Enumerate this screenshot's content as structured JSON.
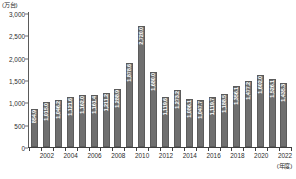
{
  "chart_data": {
    "type": "bar",
    "title": "",
    "subtitle": "",
    "xlabel": "(年度)",
    "ylabel": "(万台)",
    "ylim": [
      0,
      3000
    ],
    "ytick_labels": [
      "0",
      "500",
      "1,000",
      "1,500",
      "2,000",
      "2,500",
      "3,000"
    ],
    "ytick_values": [
      0,
      500,
      1000,
      1500,
      2000,
      2500,
      3000
    ],
    "grid": false,
    "legend": false,
    "bar_color": "#6f6f6f",
    "bar_label_color": "#ffffff",
    "axis_color": "#3f3f3f",
    "categories": [
      "2001",
      "2002",
      "2003",
      "2004",
      "2005",
      "2006",
      "2007",
      "2008",
      "2009",
      "2010",
      "2011",
      "2012",
      "2013",
      "2014",
      "2015",
      "2016",
      "2017",
      "2018",
      "2019",
      "2020",
      "2021",
      "2022"
    ],
    "xtick_labels": [
      "2002",
      "2004",
      "2006",
      "2008",
      "2010",
      "2012",
      "2014",
      "2016",
      "2018",
      "2020",
      "2022"
    ],
    "values": [
      854.9,
      1015.0,
      1046.2,
      1121.6,
      1162.0,
      1161.4,
      1211.2,
      1288.9,
      1878.6,
      2720.0,
      1680.0,
      1119.6,
      1273.2,
      1086.1,
      1047.7,
      1119.7,
      1188.5,
      1356.1,
      1477.2,
      1602.0,
      1526.1,
      1435.3
    ],
    "data_labels": [
      "854.9",
      "1,015.0",
      "1,046.2",
      "1,121.6",
      "1,162.0",
      "1,161.4",
      "1,211.2",
      "1,288.9",
      "1,878.6",
      "2,720.0",
      "1,680.0",
      "1,119.6",
      "1,273.2",
      "1,086.1",
      "1,047.7",
      "1,119.7",
      "1,188.5",
      "1,356.1",
      "1,477.2",
      "1,602.0",
      "1,526.1",
      "1,435.3"
    ]
  }
}
